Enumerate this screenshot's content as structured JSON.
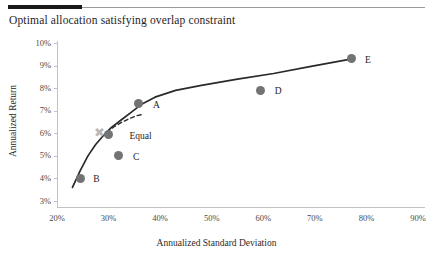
{
  "title": "Optimal allocation satisfying overlap constraint",
  "axes": {
    "x_title": "Annualized Standard Deviation",
    "y_title": "Annualized Return",
    "x_ticks": [
      "20%",
      "30%",
      "40%",
      "50%",
      "60%",
      "70%",
      "80%",
      "90%"
    ],
    "y_ticks": [
      "10%",
      "9%",
      "8%",
      "7%",
      "6%",
      "5%",
      "4%",
      "3%"
    ]
  },
  "points": [
    {
      "label": "B",
      "x": 24.5,
      "y": 4.0
    },
    {
      "label": "Equal",
      "x": 30.0,
      "y": 6.0
    },
    {
      "label": "C",
      "x": 32.0,
      "y": 5.0
    },
    {
      "label": "A",
      "x": 35.9,
      "y": 7.3
    },
    {
      "label": "D",
      "x": 59.5,
      "y": 7.9
    },
    {
      "label": "E",
      "x": 77.2,
      "y": 9.3
    }
  ],
  "colors": {
    "marker": "#737373",
    "equal_marker": "#b9b9b9",
    "frontier_line": "#2a2a2a",
    "dashed_line": "#2a2a2a",
    "axis": "#c2c2c2",
    "rule_dark": "#1a1a1a",
    "rule_light": "#9a9a9a"
  },
  "chart_data": {
    "type": "scatter",
    "title": "Optimal allocation satisfying overlap constraint",
    "xlabel": "Annualized Standard Deviation",
    "ylabel": "Annualized Return",
    "xlim": [
      20,
      90
    ],
    "ylim": [
      3,
      10
    ],
    "xticks": [
      20,
      30,
      40,
      50,
      60,
      70,
      80,
      90
    ],
    "yticks": [
      3,
      4,
      5,
      6,
      7,
      8,
      9,
      10
    ],
    "xtick_labels": [
      "20%",
      "30%",
      "40%",
      "50%",
      "60%",
      "70%",
      "80%",
      "90%"
    ],
    "ytick_labels": [
      "3%",
      "4%",
      "5%",
      "6%",
      "7%",
      "8%",
      "9%",
      "10%"
    ],
    "grid": false,
    "legend": null,
    "points": [
      {
        "name": "B",
        "x": 24.5,
        "y": 4.0
      },
      {
        "name": "Equal",
        "x": 30.0,
        "y": 6.0
      },
      {
        "name": "C",
        "x": 32.0,
        "y": 5.0
      },
      {
        "name": "A",
        "x": 35.9,
        "y": 7.3
      },
      {
        "name": "D",
        "x": 59.5,
        "y": 7.9
      },
      {
        "name": "E",
        "x": 77.2,
        "y": 9.3
      }
    ],
    "series": [
      {
        "name": "efficient-frontier",
        "style": "solid",
        "x": [
          23.0,
          24.5,
          26.0,
          27.5,
          29.0,
          30.5,
          32.5,
          34.5,
          36.5,
          39.0,
          43.0,
          48.0,
          55.0,
          62.0,
          69.0,
          77.2
        ],
        "y": [
          3.6,
          4.35,
          5.0,
          5.5,
          5.9,
          6.25,
          6.6,
          6.95,
          7.3,
          7.6,
          7.9,
          8.12,
          8.4,
          8.65,
          8.95,
          9.3
        ]
      },
      {
        "name": "overlap-constrained",
        "style": "dashed",
        "x": [
          29.6,
          31.0,
          32.5,
          34.0,
          35.5,
          36.8
        ],
        "y": [
          6.05,
          6.28,
          6.48,
          6.65,
          6.78,
          6.85
        ]
      }
    ]
  }
}
